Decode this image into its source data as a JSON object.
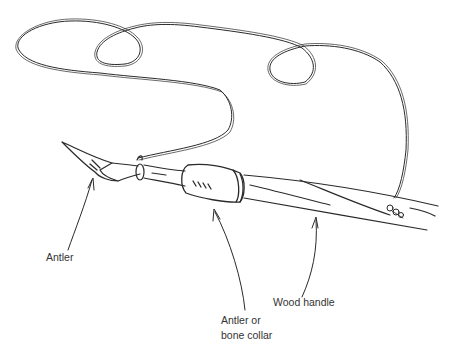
{
  "diagram": {
    "labels": {
      "antler": "Antler",
      "collar_line1": "Antler or",
      "collar_line2": "bone collar",
      "handle": "Wood handle"
    },
    "colors": {
      "ink": "#2a2a2a",
      "text": "#333333",
      "background": "#ffffff"
    }
  }
}
